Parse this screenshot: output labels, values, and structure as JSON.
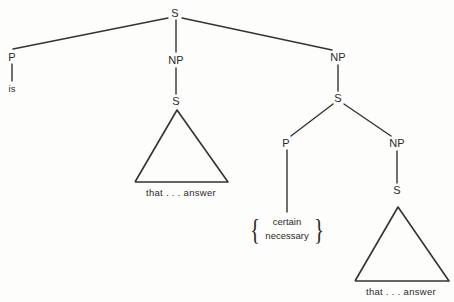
{
  "diagram": {
    "type": "syntax-tree",
    "width": 454,
    "height": 302,
    "line_color": "#333333",
    "text_color": "#2a2a2a",
    "background": "#fdfdfc",
    "nodes": [
      {
        "id": "s-root",
        "label": "S",
        "x": 175,
        "y": 13
      },
      {
        "id": "p-left",
        "label": "P",
        "x": 12,
        "y": 57
      },
      {
        "id": "is-terminal",
        "label": "is",
        "x": 12,
        "y": 88
      },
      {
        "id": "np-mid",
        "label": "NP",
        "x": 176,
        "y": 60
      },
      {
        "id": "s-mid",
        "label": "S",
        "x": 176,
        "y": 101
      },
      {
        "id": "np-right",
        "label": "NP",
        "x": 338,
        "y": 57
      },
      {
        "id": "s-right",
        "label": "S",
        "x": 338,
        "y": 98
      },
      {
        "id": "p-right",
        "label": "P",
        "x": 286,
        "y": 143
      },
      {
        "id": "np-lower",
        "label": "NP",
        "x": 397,
        "y": 143
      },
      {
        "id": "s-lower",
        "label": "S",
        "x": 397,
        "y": 190
      }
    ],
    "edges": [
      {
        "id": "edge-root-to-p-left",
        "from": "s-root",
        "to": "p-left",
        "x1": 168,
        "y1": 18,
        "x2": 13,
        "y2": 49
      },
      {
        "id": "edge-root-to-np-right",
        "from": "s-root",
        "to": "np-right",
        "x1": 182,
        "y1": 18,
        "x2": 332,
        "y2": 50
      },
      {
        "id": "edge-root-to-np-mid",
        "from": "s-root",
        "to": "np-mid",
        "x1": 176,
        "y1": 20,
        "x2": 176,
        "y2": 52
      },
      {
        "id": "edge-p-left-to-is",
        "from": "p-left",
        "to": "is",
        "x1": 12,
        "y1": 64,
        "x2": 12,
        "y2": 81
      },
      {
        "id": "edge-np-mid-to-s-mid",
        "from": "np-mid",
        "to": "s-mid",
        "x1": 176,
        "y1": 68,
        "x2": 176,
        "y2": 94
      },
      {
        "id": "edge-np-right-to-s",
        "from": "np-right",
        "to": "s-right",
        "x1": 338,
        "y1": 65,
        "x2": 338,
        "y2": 91
      },
      {
        "id": "edge-s-right-to-p",
        "from": "s-right",
        "to": "p-right",
        "x1": 333,
        "y1": 104,
        "x2": 291,
        "y2": 136
      },
      {
        "id": "edge-s-right-to-np",
        "from": "s-right",
        "to": "np-lower",
        "x1": 344,
        "y1": 104,
        "x2": 391,
        "y2": 136
      },
      {
        "id": "edge-p-right-to-brace",
        "from": "p-right",
        "to": "brace",
        "x1": 287,
        "y1": 150,
        "x2": 287,
        "y2": 212
      },
      {
        "id": "edge-np-lower-to-s",
        "from": "np-lower",
        "to": "s-lower",
        "x1": 397,
        "y1": 151,
        "x2": 397,
        "y2": 183
      }
    ],
    "triangles": [
      {
        "id": "triangle-left",
        "label": "that . . . answer",
        "apex_x": 177,
        "apex_y": 110,
        "left_x": 135,
        "left_y": 182,
        "right_x": 228,
        "right_y": 182,
        "label_x": 181,
        "label_y": 192
      },
      {
        "id": "triangle-right",
        "label": "that . . . answer",
        "apex_x": 398,
        "apex_y": 207,
        "left_x": 355,
        "left_y": 281,
        "right_x": 449,
        "right_y": 281,
        "label_x": 401,
        "label_y": 291
      }
    ],
    "brace_group": {
      "id": "brace-alternatives",
      "x": 287,
      "y": 229,
      "left_brace": "{",
      "right_brace": "}",
      "items": [
        "certain",
        "necessary"
      ]
    }
  }
}
